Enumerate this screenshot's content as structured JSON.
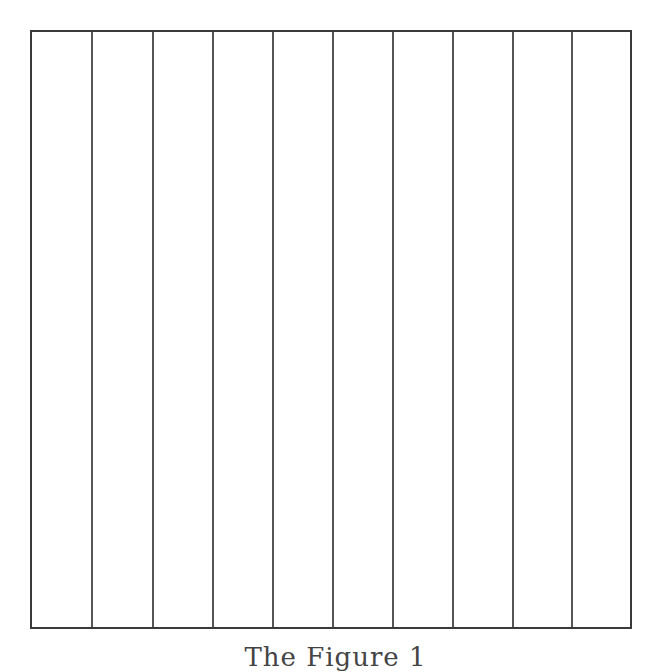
{
  "figure": {
    "type": "vertical-column-grid",
    "columns": 10,
    "border_color": "#3a3a3a",
    "line_color": "#555555",
    "background": "#ffffff",
    "line_positions_px": [
      91,
      152,
      212,
      272,
      332,
      392,
      452,
      512,
      571
    ],
    "box": {
      "left": 31,
      "top": 31,
      "right": 630,
      "bottom": 627
    }
  },
  "caption": {
    "text": "The Figure 1",
    "note_visible": "partially cut off at bottom edge"
  }
}
